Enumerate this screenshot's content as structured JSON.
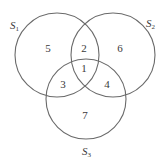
{
  "diagram": {
    "type": "venn",
    "colors": {
      "stroke": "#6a6a6a",
      "text": "#3a3a3a",
      "background": "#ffffff"
    },
    "sets": [
      {
        "id": "S1",
        "letter": "S",
        "subscript": "1",
        "cx": 57,
        "cy": 55,
        "r": 42,
        "label_x": 10,
        "label_y": 29
      },
      {
        "id": "S2",
        "letter": "S",
        "subscript": "2",
        "cx": 113,
        "cy": 55,
        "r": 42,
        "label_x": 146,
        "label_y": 27
      },
      {
        "id": "S3",
        "letter": "S",
        "subscript": "3",
        "cx": 86,
        "cy": 99,
        "r": 40,
        "label_x": 82,
        "label_y": 155
      }
    ],
    "regions": [
      {
        "label": "1",
        "description": "S1 ∩ S2 ∩ S3",
        "x": 84,
        "y": 68
      },
      {
        "label": "2",
        "description": "S1 ∩ S2 only",
        "x": 84,
        "y": 48
      },
      {
        "label": "3",
        "description": "S1 ∩ S3 only",
        "x": 63,
        "y": 84
      },
      {
        "label": "4",
        "description": "S2 ∩ S3 only",
        "x": 107,
        "y": 84
      },
      {
        "label": "5",
        "description": "S1 only",
        "x": 48,
        "y": 48
      },
      {
        "label": "6",
        "description": "S2 only",
        "x": 120,
        "y": 48
      },
      {
        "label": "7",
        "description": "S3 only",
        "x": 85,
        "y": 115
      }
    ]
  }
}
